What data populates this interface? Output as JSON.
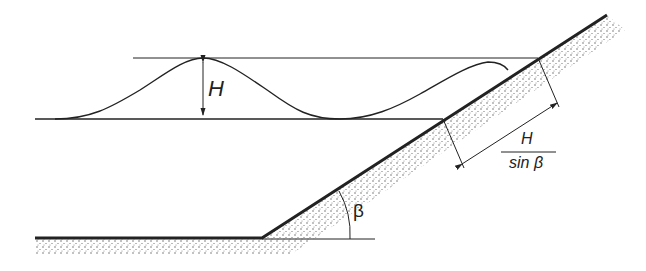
{
  "diagram": {
    "type": "wave-on-slope",
    "labels": {
      "wave_height": "H",
      "fraction_numerator": "H",
      "fraction_denominator": "sin β",
      "slope_angle": "β"
    },
    "colors": {
      "line": "#222222",
      "ground_dots": "#555555",
      "background": "#ffffff"
    }
  }
}
